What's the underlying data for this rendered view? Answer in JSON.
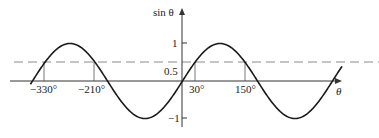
{
  "chart_data": {
    "type": "line",
    "title": "",
    "xlabel": "θ",
    "ylabel": "sin θ",
    "series": [
      {
        "name": "sin θ",
        "function": "sin(theta)",
        "x_range_deg": [
          -365,
          384
        ],
        "style": "solid"
      },
      {
        "name": "y = 0.5",
        "value": 0.5,
        "style": "dashed"
      }
    ],
    "y_ticks": [
      {
        "value": 1,
        "label": "1"
      },
      {
        "value": 0.5,
        "label": "0.5"
      },
      {
        "value": -1,
        "label": "−1"
      }
    ],
    "x_marked_points": [
      {
        "value": -330,
        "label": "−330°"
      },
      {
        "value": -210,
        "label": "−210°"
      },
      {
        "value": 30,
        "label": "30°"
      },
      {
        "value": 150,
        "label": "150°"
      }
    ],
    "ylim": [
      -1.1,
      1.5
    ],
    "grid": false,
    "legend": "none"
  },
  "labels": {
    "y_axis": "sin θ",
    "x_axis": "θ",
    "y_one": "1",
    "y_half": "0.5",
    "y_neg_one": "−1",
    "x_m330": "−330°",
    "x_m210": "−210°",
    "x_30": "30°",
    "x_150": "150°"
  },
  "colors": {
    "curve": "#1a1a1a",
    "axis": "#333333",
    "dashed": "#888888"
  }
}
